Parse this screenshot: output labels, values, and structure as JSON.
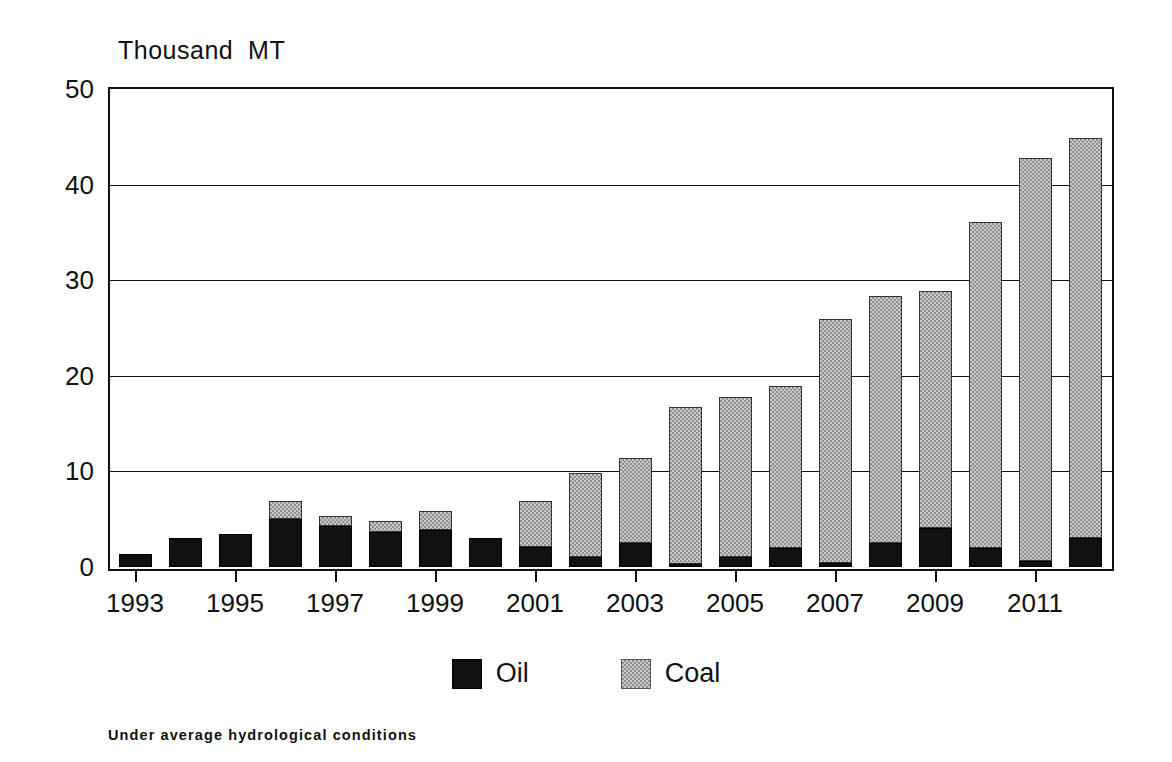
{
  "chart_data": {
    "type": "bar",
    "stacked": true,
    "title": "",
    "unit_title": "Thousand  MT",
    "xlabel": "",
    "ylabel": "Thousand MT",
    "ylim": [
      0,
      50
    ],
    "ytick_values": [
      0,
      10,
      20,
      30,
      40,
      50
    ],
    "ytick_labels": [
      "0",
      "10",
      "20",
      "30",
      "40",
      "50"
    ],
    "grid": true,
    "grid_axis": "y",
    "legend_position": "bottom-center",
    "footnote": "Under average hydrological conditions",
    "categories": [
      1993,
      1994,
      1995,
      1996,
      1997,
      1998,
      1999,
      2000,
      2001,
      2002,
      2003,
      2004,
      2005,
      2006,
      2007,
      2008,
      2009,
      2010,
      2011,
      2012
    ],
    "xtick_labels": [
      "1993",
      "1995",
      "1997",
      "1999",
      "2001",
      "2003",
      "2005",
      "2007",
      "2009",
      "2011"
    ],
    "xtick_categories": [
      1993,
      1995,
      1997,
      1999,
      2001,
      2003,
      2005,
      2007,
      2009,
      2011
    ],
    "series": [
      {
        "name": "Oil",
        "color": "#111111",
        "values": [
          1.4,
          3.0,
          3.5,
          5.0,
          4.3,
          3.7,
          3.9,
          3.0,
          2.1,
          1.0,
          2.5,
          0.3,
          1.0,
          2.0,
          0.4,
          2.5,
          4.1,
          2.0,
          0.6,
          3.0
        ]
      },
      {
        "name": "Coal",
        "color": "#c9c9c9",
        "values": [
          0.0,
          0.0,
          0.0,
          1.9,
          1.0,
          1.1,
          2.0,
          0.0,
          4.8,
          8.8,
          8.9,
          16.4,
          16.8,
          16.9,
          25.5,
          25.8,
          24.8,
          34.1,
          42.2,
          41.9
        ]
      }
    ],
    "totals": [
      1.4,
      3.0,
      3.5,
      6.9,
      5.3,
      4.8,
      5.9,
      3.0,
      6.9,
      9.8,
      11.4,
      16.7,
      17.8,
      18.9,
      25.9,
      28.3,
      28.9,
      36.1,
      42.8,
      44.9
    ]
  },
  "legend": {
    "items": [
      {
        "label": "Oil",
        "swatch": "oil"
      },
      {
        "label": "Coal",
        "swatch": "coal"
      }
    ]
  }
}
